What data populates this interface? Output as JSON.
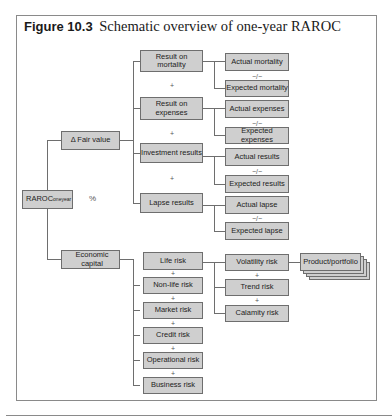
{
  "figure": {
    "label": "Figure 10.3",
    "title": "Schematic overview of one-year RAROC"
  },
  "root": {
    "label": "RAROC",
    "subscript": "oneyear",
    "operator": "%"
  },
  "level1": {
    "fair_value": "Δ Fair value",
    "economic_capital": "Economic capital"
  },
  "fair_value_components": [
    {
      "label": "Result on mortality",
      "actual": "Actual mortality",
      "expected": "Expected mortality"
    },
    {
      "label": "Result on expenses",
      "actual": "Actual expenses",
      "expected": "Expected expenses"
    },
    {
      "label": "Investment results",
      "actual": "Actual results",
      "expected": "Expected results"
    },
    {
      "label": "Lapse results",
      "actual": "Actual lapse",
      "expected": "Expected lapse"
    }
  ],
  "capital_components": [
    "Life risk",
    "Non-life risk",
    "Market risk",
    "Credit risk",
    "Operational risk",
    "Business risk"
  ],
  "life_risk_components": [
    "Volatility risk",
    "Trend risk",
    "Calamity risk"
  ],
  "granularity": "Product/portfolio",
  "operators": {
    "plus": "+",
    "minus": "−/−"
  }
}
